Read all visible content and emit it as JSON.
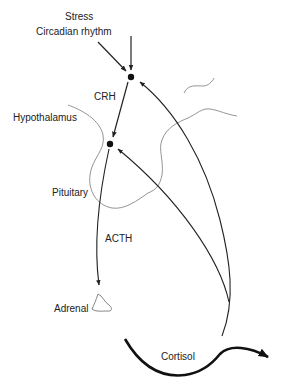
{
  "diagram": {
    "labels": {
      "stress": "Stress",
      "circadian": "Circadian rhythm",
      "crh": "CRH",
      "hypothalamus": "Hypothalamus",
      "pituitary": "Pituitary",
      "acth": "ACTH",
      "adrenal": "Adrenal",
      "cortisol": "Cortisol"
    },
    "colors": {
      "ink": "#222222",
      "outline": "#777777"
    }
  }
}
